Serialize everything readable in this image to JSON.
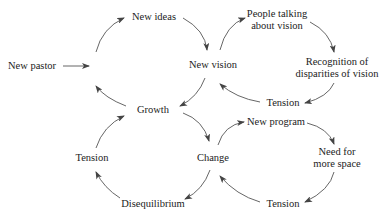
{
  "diagram": {
    "type": "cycle-diagram",
    "nodes": {
      "new_pastor": "New pastor",
      "new_ideas": "New ideas",
      "new_vision": "New vision",
      "growth": "Growth",
      "people_talking_1": "People talking",
      "people_talking_2": "about vision",
      "recognition_1": "Recognition of",
      "recognition_2": "disparities of vision",
      "tension_top": "Tension",
      "change": "Change",
      "tension_left": "Tension",
      "disequilibrium": "Disequilibrium",
      "new_program": "New program",
      "need_space_1": "Need for",
      "need_space_2": "more space",
      "tension_bottom": "Tension"
    },
    "edges": [
      [
        "New pastor",
        "New ideas/Growth cycle"
      ],
      [
        "Growth",
        "New ideas"
      ],
      [
        "New ideas",
        "New vision"
      ],
      [
        "New vision",
        "Growth"
      ],
      [
        "New vision",
        "People talking about vision"
      ],
      [
        "People talking about vision",
        "Recognition of disparities of vision"
      ],
      [
        "Recognition of disparities of vision",
        "Tension"
      ],
      [
        "Tension",
        "New vision"
      ],
      [
        "Growth",
        "Change"
      ],
      [
        "Change",
        "Disequilibrium"
      ],
      [
        "Disequilibrium",
        "Tension"
      ],
      [
        "Tension",
        "Growth"
      ],
      [
        "Change",
        "New program"
      ],
      [
        "New program",
        "Need for more space"
      ],
      [
        "Need for more space",
        "Tension"
      ],
      [
        "Tension",
        "Change"
      ]
    ]
  }
}
